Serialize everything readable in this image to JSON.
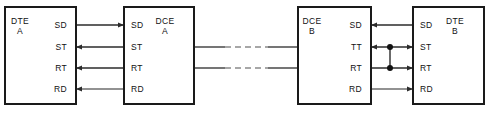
{
  "diagram": {
    "canvas": {
      "width": 489,
      "height": 118,
      "background": "#ffffff"
    },
    "colors": {
      "box_stroke": "#1a1a1a",
      "box_fill": "#ffffff",
      "line_dark": "#2b2b2b",
      "line_gray": "#6e6e6e",
      "trunk_dash": "#8a8a8a",
      "junction_dot": "#111111",
      "text": "#111111"
    },
    "boxes": [
      {
        "id": "dte-a",
        "title_line1": "DTE",
        "title_line2": "A",
        "title_x": 20,
        "title_y": 24,
        "x": 5,
        "y": 7,
        "width": 71,
        "height": 97,
        "label_side": "right",
        "signals": [
          {
            "name": "SD",
            "y": 25,
            "x": 67
          },
          {
            "name": "ST",
            "y": 47,
            "x": 67
          },
          {
            "name": "RT",
            "y": 68,
            "x": 67
          },
          {
            "name": "RD",
            "y": 89,
            "x": 67
          }
        ]
      },
      {
        "id": "dce-a",
        "title_line1": "DCE",
        "title_line2": "A",
        "title_x": 165,
        "title_y": 24,
        "x": 124,
        "y": 7,
        "width": 70,
        "height": 97,
        "label_side": "left",
        "signals": [
          {
            "name": "SD",
            "y": 25,
            "x": 131
          },
          {
            "name": "ST",
            "y": 47,
            "x": 131
          },
          {
            "name": "RT",
            "y": 68,
            "x": 131
          },
          {
            "name": "RD",
            "y": 89,
            "x": 131
          }
        ]
      },
      {
        "id": "dce-b",
        "title_line1": "DCE",
        "title_line2": "B",
        "title_x": 312,
        "title_y": 24,
        "x": 298,
        "y": 7,
        "width": 73,
        "height": 97,
        "label_side": "right",
        "signals": [
          {
            "name": "SD",
            "y": 25,
            "x": 362
          },
          {
            "name": "TT",
            "y": 47,
            "x": 362
          },
          {
            "name": "RT",
            "y": 68,
            "x": 362
          },
          {
            "name": "RD",
            "y": 89,
            "x": 362
          }
        ]
      },
      {
        "id": "dte-b",
        "title_line1": "DTE",
        "title_line2": "B",
        "title_x": 455,
        "title_y": 24,
        "x": 413,
        "y": 7,
        "width": 71,
        "height": 97,
        "label_side": "left",
        "signals": [
          {
            "name": "SD",
            "y": 25,
            "x": 420
          },
          {
            "name": "ST",
            "y": 47,
            "x": 420
          },
          {
            "name": "RT",
            "y": 68,
            "x": 420
          },
          {
            "name": "RD",
            "y": 89,
            "x": 420
          }
        ]
      }
    ],
    "left_links": [
      {
        "signal": "SD",
        "y": 25,
        "x1": 76,
        "x2": 124,
        "direction": "right",
        "tone": "dark"
      },
      {
        "signal": "ST",
        "y": 47,
        "x1": 76,
        "x2": 124,
        "direction": "left",
        "tone": "dark"
      },
      {
        "signal": "RT",
        "y": 68,
        "x1": 76,
        "x2": 124,
        "direction": "left",
        "tone": "dark"
      },
      {
        "signal": "RD",
        "y": 89,
        "x1": 76,
        "x2": 124,
        "direction": "left",
        "tone": "gray"
      }
    ],
    "right_links": [
      {
        "signal": "SD",
        "y": 25,
        "x1": 371,
        "x2": 413,
        "direction": "left",
        "tone": "dark"
      },
      {
        "signal": "TT",
        "y": 47,
        "x1": 371,
        "x2": 413,
        "direction": "both",
        "tone": "dark"
      },
      {
        "signal": "RT",
        "y": 68,
        "x1": 371,
        "x2": 413,
        "direction": "right",
        "tone": "dark"
      },
      {
        "signal": "RD",
        "y": 89,
        "x1": 371,
        "x2": 413,
        "direction": "right",
        "tone": "gray"
      }
    ],
    "junctions": [
      {
        "id": "tt-tap",
        "x": 390,
        "y": 47,
        "r": 3
      },
      {
        "id": "rt-tap",
        "x": 390,
        "y": 68,
        "r": 3
      }
    ],
    "junction_bridge": {
      "x": 390,
      "y1": 47,
      "y2": 68
    },
    "trunk": {
      "x1": 194,
      "x2": 298,
      "dash_x1": 225,
      "dash_x2": 268,
      "lines": [
        {
          "id": "trunk-upper",
          "y": 47
        },
        {
          "id": "trunk-lower",
          "y": 68
        }
      ]
    }
  }
}
